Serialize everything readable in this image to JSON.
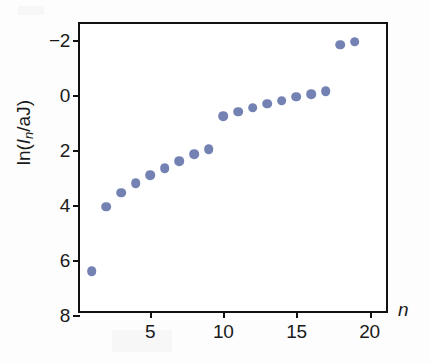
{
  "figure": {
    "background_color": "#fdfdfd",
    "plot_background_color": "#ffffff",
    "axis_color": "#111111",
    "marker_color": "#7382b2"
  },
  "axes": {
    "x_label": "n",
    "y_label_prefix": "ln(",
    "y_label_italic_I": "I",
    "y_label_sub_n": "n",
    "y_label_suffix": "/aJ)",
    "x_ticks": [
      "5",
      "10",
      "15",
      "20"
    ],
    "y_ticks": [
      "8",
      "6",
      "4",
      "2",
      "0",
      "−2"
    ]
  },
  "chart_data": {
    "type": "scatter",
    "title": "",
    "xlabel": "n",
    "ylabel": "ln(I_n/aJ)",
    "xlim": [
      0.2,
      21.4
    ],
    "ylim": [
      -2,
      8.6
    ],
    "x_ticks": [
      5,
      10,
      15,
      20
    ],
    "y_ticks": [
      -2,
      0,
      2,
      4,
      6,
      8
    ],
    "grid": false,
    "legend": false,
    "marker": "filled-circle",
    "marker_color": "#7382b2",
    "x": [
      1,
      2,
      3,
      4,
      5,
      6,
      7,
      8,
      9,
      10,
      11,
      12,
      13,
      14,
      15,
      16,
      17,
      18,
      19
    ],
    "values": [
      -0.4,
      1.95,
      2.45,
      2.8,
      3.1,
      3.35,
      3.6,
      3.85,
      4.05,
      5.25,
      5.4,
      5.55,
      5.7,
      5.8,
      5.95,
      6.05,
      6.15,
      7.85,
      7.95
    ],
    "points": [
      {
        "n": 1,
        "ln_I": -0.4
      },
      {
        "n": 2,
        "ln_I": 1.95
      },
      {
        "n": 3,
        "ln_I": 2.45
      },
      {
        "n": 4,
        "ln_I": 2.8
      },
      {
        "n": 5,
        "ln_I": 3.1
      },
      {
        "n": 6,
        "ln_I": 3.35
      },
      {
        "n": 7,
        "ln_I": 3.6
      },
      {
        "n": 8,
        "ln_I": 3.85
      },
      {
        "n": 9,
        "ln_I": 4.05
      },
      {
        "n": 10,
        "ln_I": 5.25
      },
      {
        "n": 11,
        "ln_I": 5.4
      },
      {
        "n": 12,
        "ln_I": 5.55
      },
      {
        "n": 13,
        "ln_I": 5.7
      },
      {
        "n": 14,
        "ln_I": 5.8
      },
      {
        "n": 15,
        "ln_I": 5.95
      },
      {
        "n": 16,
        "ln_I": 6.05
      },
      {
        "n": 17,
        "ln_I": 6.15
      },
      {
        "n": 18,
        "ln_I": 7.85
      },
      {
        "n": 19,
        "ln_I": 7.95
      }
    ]
  }
}
